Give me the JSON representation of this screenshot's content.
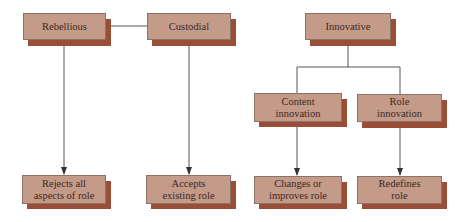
{
  "diagram": {
    "type": "hierarchy-flow",
    "colors": {
      "box_fill": "#c49a88",
      "box_shadow": "#9a4e37",
      "box_border": "#8a7468",
      "line": "#555555",
      "text": "#3a2a26"
    },
    "nodes": {
      "rebellious": {
        "label": "Rebellious"
      },
      "custodial": {
        "label": "Custodial"
      },
      "innovative": {
        "label": "Innovative"
      },
      "content_innovation": {
        "label_line1": "Content",
        "label_line2": "innovation"
      },
      "role_innovation": {
        "label_line1": "Role",
        "label_line2": "innovation"
      },
      "rejects": {
        "label_line1": "Rejects all",
        "label_line2": "aspects of role"
      },
      "accepts": {
        "label_line1": "Accepts",
        "label_line2": "existing role"
      },
      "changes": {
        "label_line1": "Changes or",
        "label_line2": "improves role"
      },
      "redefines": {
        "label_line1": "Redefines",
        "label_line2": "role"
      }
    },
    "edges": [
      {
        "from": "Rebellious",
        "to": "Custodial",
        "type": "line"
      },
      {
        "from": "Rebellious",
        "to": "Rejects all aspects of role",
        "type": "arrow"
      },
      {
        "from": "Custodial",
        "to": "Accepts existing role",
        "type": "arrow"
      },
      {
        "from": "Innovative",
        "to": "Content innovation",
        "type": "line"
      },
      {
        "from": "Innovative",
        "to": "Role innovation",
        "type": "line"
      },
      {
        "from": "Content innovation",
        "to": "Changes or improves role",
        "type": "arrow"
      },
      {
        "from": "Role innovation",
        "to": "Redefines role",
        "type": "arrow"
      }
    ]
  }
}
